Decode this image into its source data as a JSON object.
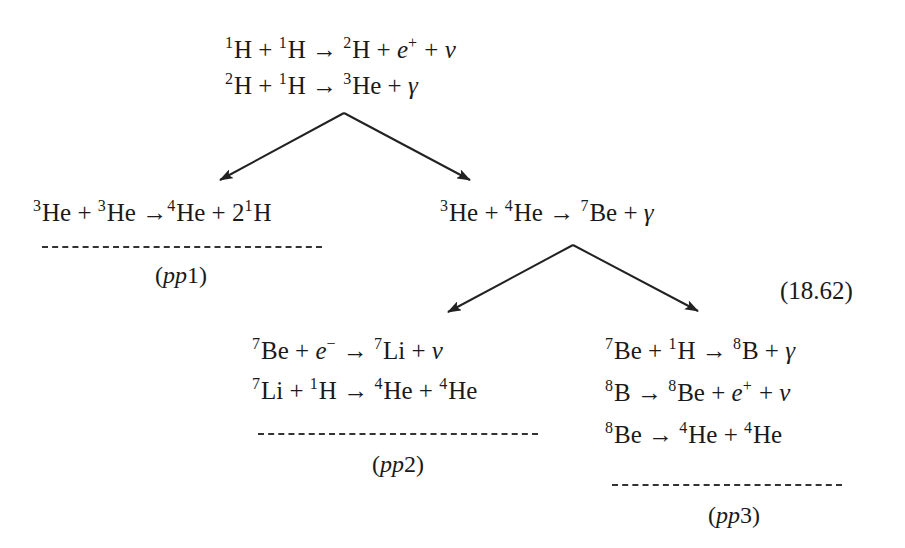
{
  "equation_number": "(18.62)",
  "start": {
    "lines": [
      {
        "parts": [
          {
            "sup": "1",
            "t": "H + "
          },
          {
            "sup": "1",
            "t": "H → "
          },
          {
            "sup": "2",
            "t": "H + "
          },
          {
            "it": "e",
            "sup": "+",
            "t": " + "
          },
          {
            "it": "ν"
          }
        ]
      },
      {
        "parts": [
          {
            "sup": "2",
            "t": "H + "
          },
          {
            "sup": "1",
            "t": "H → "
          },
          {
            "sup": "3",
            "t": "He + "
          },
          {
            "it": "γ"
          }
        ]
      }
    ]
  },
  "pp1": {
    "lines": [
      {
        "parts": [
          {
            "sup": "3",
            "t": "He + "
          },
          {
            "sup": "3",
            "t": "He →"
          },
          {
            "sup": "4",
            "t": "He + 2"
          },
          {
            "sup": "1",
            "t": "H"
          }
        ]
      }
    ],
    "label_prefix": "(",
    "label_it": "pp",
    "label_num": "1",
    "label_suffix": ")"
  },
  "branch": {
    "lines": [
      {
        "parts": [
          {
            "sup": "3",
            "t": "He + "
          },
          {
            "sup": "4",
            "t": "He → "
          },
          {
            "sup": "7",
            "t": "Be + "
          },
          {
            "it": "γ"
          }
        ]
      }
    ]
  },
  "pp2": {
    "lines": [
      {
        "parts": [
          {
            "sup": "7",
            "t": "Be + "
          },
          {
            "it": "e",
            "sup": "−",
            "t": " → "
          },
          {
            "sup": "7",
            "t": "Li + "
          },
          {
            "it": "ν"
          }
        ]
      },
      {
        "parts": [
          {
            "sup": "7",
            "t": "Li + "
          },
          {
            "sup": "1",
            "t": "H → "
          },
          {
            "sup": "4",
            "t": "He + "
          },
          {
            "sup": "4",
            "t": "He"
          }
        ]
      }
    ],
    "label_prefix": "(",
    "label_it": "pp",
    "label_num": "2",
    "label_suffix": ")"
  },
  "pp3": {
    "lines": [
      {
        "parts": [
          {
            "sup": "7",
            "t": "Be + "
          },
          {
            "sup": "1",
            "t": "H → "
          },
          {
            "sup": "8",
            "t": "B + "
          },
          {
            "it": "γ"
          }
        ]
      },
      {
        "parts": [
          {
            "sup": "8",
            "t": "B → "
          },
          {
            "sup": "8",
            "t": "Be + "
          },
          {
            "it": "e",
            "sup": "+",
            "t": " + "
          },
          {
            "it": "ν"
          }
        ]
      },
      {
        "parts": [
          {
            "sup": "8",
            "t": "Be → "
          },
          {
            "sup": "4",
            "t": "He + "
          },
          {
            "sup": "4",
            "t": "He"
          }
        ]
      }
    ],
    "label_prefix": "(",
    "label_it": "pp",
    "label_num": "3",
    "label_suffix": ")"
  }
}
